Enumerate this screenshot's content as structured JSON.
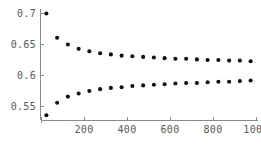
{
  "chart_data": {
    "type": "scatter",
    "title": "",
    "subtitle": "",
    "xlabel": "",
    "ylabel": "",
    "xlim": [
      0,
      1000
    ],
    "ylim": [
      0.525,
      0.705
    ],
    "grid": false,
    "legend": null,
    "x_ticks": [
      200,
      400,
      600,
      800,
      1000
    ],
    "x_tick_labels": [
      "200",
      "400",
      "600",
      "800",
      "1000"
    ],
    "y_ticks": [
      0.55,
      0.6,
      0.65,
      0.7
    ],
    "y_tick_labels": [
      "0.55",
      "0.6",
      "0.65",
      "0.7"
    ],
    "marker": "filled-circle",
    "marker_color": "#101010",
    "axis_color": "#8a8a8a",
    "background_color": "#ffffff",
    "x": [
      25,
      75,
      125,
      175,
      225,
      275,
      325,
      375,
      425,
      475,
      525,
      575,
      625,
      675,
      725,
      775,
      825,
      875,
      925,
      975
    ],
    "series": [
      {
        "name": "upper-bound",
        "values": [
          0.7,
          0.661,
          0.65,
          0.643,
          0.639,
          0.636,
          0.634,
          0.632,
          0.631,
          0.63,
          0.629,
          0.628,
          0.627,
          0.627,
          0.626,
          0.625,
          0.625,
          0.624,
          0.624,
          0.623
        ]
      },
      {
        "name": "lower-bound",
        "values": [
          0.536,
          0.556,
          0.566,
          0.571,
          0.575,
          0.578,
          0.58,
          0.581,
          0.583,
          0.584,
          0.585,
          0.586,
          0.587,
          0.588,
          0.588,
          0.589,
          0.59,
          0.59,
          0.591,
          0.592
        ]
      }
    ]
  },
  "axes": {
    "x_axis_name": "x-axis",
    "y_axis_name": "y-axis"
  }
}
